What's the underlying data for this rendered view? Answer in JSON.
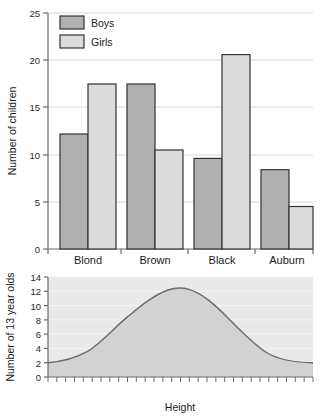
{
  "chart_data": [
    {
      "id": "hair-colour-bar-chart",
      "type": "bar",
      "title": "",
      "xlabel": "",
      "ylabel": "Number of children",
      "categories": [
        "Blond",
        "Brown",
        "Black",
        "Auburn"
      ],
      "series": [
        {
          "name": "Boys",
          "values": [
            12.2,
            17.5,
            9.6,
            8.4
          ],
          "color": "#b0b0b0"
        },
        {
          "name": "Girls",
          "values": [
            17.5,
            10.5,
            20.6,
            4.5
          ],
          "color": "#dcdcdc"
        }
      ],
      "ylim": [
        0,
        25
      ],
      "yticks": [
        0,
        5,
        10,
        15,
        20,
        25
      ],
      "ytick_labels": [
        "0",
        "5",
        "10",
        "15",
        "20",
        "25"
      ],
      "grid": true,
      "legend": {
        "position": "top-left",
        "entries": [
          "Boys",
          "Girls"
        ]
      }
    },
    {
      "id": "height-distribution-curve",
      "type": "area",
      "title": "",
      "xlabel": "Height",
      "ylabel": "Number of 13 year olds",
      "ylim": [
        0,
        14
      ],
      "yticks": [
        0,
        2,
        4,
        6,
        8,
        10,
        12,
        14
      ],
      "ytick_labels": [
        "0",
        "2",
        "4",
        "6",
        "8",
        "10",
        "12",
        "14"
      ],
      "xticks_count": 30,
      "xtick_labels": [],
      "grid": true,
      "peak_value": 12.3,
      "edge_value": 2.0,
      "x": [
        0,
        0.05,
        0.1,
        0.15,
        0.2,
        0.25,
        0.3,
        0.35,
        0.4,
        0.45,
        0.5,
        0.55,
        0.6,
        0.65,
        0.7,
        0.75,
        0.8,
        0.85,
        0.9,
        0.95,
        1.0
      ],
      "values": [
        2.0,
        2.2,
        2.7,
        3.5,
        4.6,
        6.0,
        7.6,
        9.1,
        10.4,
        11.5,
        12.2,
        12.3,
        11.9,
        11.0,
        9.8,
        8.3,
        6.7,
        5.2,
        3.9,
        2.8,
        2.0
      ]
    }
  ],
  "colors": {
    "boys_fill": "#b0b0b0",
    "girls_fill": "#dcdcdc",
    "bar_stroke": "#333333",
    "axis": "#6b6b6b",
    "grid": "#d8d8d8",
    "curve_stroke": "#6a6a6a",
    "curve_fill": "#d2d2d2",
    "panel_fill": "#e9e9e9"
  }
}
